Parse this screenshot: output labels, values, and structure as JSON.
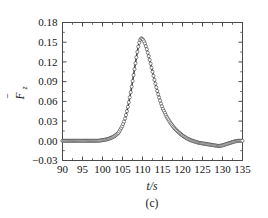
{
  "figure": {
    "caption": "(c)",
    "background_color": "#ffffff",
    "curve_color": "#3a3a3a",
    "axis_color": "#4a4a4a",
    "text_color": "#151515"
  },
  "chart_data": {
    "type": "line",
    "title": "",
    "subtitle": "",
    "xlabel": "t/s",
    "ylabel": "F̄z",
    "ylabel_parts": {
      "symbol": "F",
      "overbar": true,
      "subscript": "z"
    },
    "xlim": [
      90,
      135
    ],
    "ylim": [
      -0.03,
      0.18
    ],
    "xticks": [
      90,
      95,
      100,
      105,
      110,
      115,
      120,
      125,
      130,
      135
    ],
    "xtick_labels": [
      "90",
      "95",
      "100",
      "105",
      "110",
      "115",
      "120",
      "125",
      "130",
      "135"
    ],
    "yticks": [
      -0.03,
      0.0,
      0.03,
      0.06,
      0.09,
      0.12,
      0.15,
      0.18
    ],
    "ytick_labels": [
      "−0.03",
      "0.00",
      "0.03",
      "0.06",
      "0.09",
      "0.12",
      "0.15",
      "0.18"
    ],
    "x_minor_per_major": 1,
    "y_minor_per_major": 1,
    "grid": false,
    "legend": null,
    "marker": "open-circle",
    "marker_size": 1.6,
    "peak": {
      "x": 109.6,
      "y": 0.156
    },
    "baseline": 0.0,
    "x": [
      90,
      91,
      92,
      93,
      94,
      95,
      96,
      97,
      98,
      99,
      100,
      101,
      102,
      103,
      104,
      105,
      105.5,
      106,
      106.5,
      107,
      107.5,
      108,
      108.5,
      109,
      109.3,
      109.6,
      110,
      110.5,
      111,
      111.5,
      112,
      112.5,
      113,
      113.5,
      114,
      114.5,
      115,
      116,
      117,
      118,
      119,
      120,
      121,
      122,
      123,
      124,
      125,
      126,
      127,
      128,
      129,
      130,
      131,
      132,
      133,
      134,
      135
    ],
    "y": [
      0.0,
      0.0,
      0.0,
      0.0,
      0.0,
      0.0,
      0.0,
      0.0,
      0.0,
      0.0,
      0.001,
      0.002,
      0.004,
      0.007,
      0.012,
      0.023,
      0.031,
      0.042,
      0.056,
      0.072,
      0.09,
      0.109,
      0.128,
      0.145,
      0.152,
      0.156,
      0.155,
      0.15,
      0.141,
      0.13,
      0.118,
      0.105,
      0.092,
      0.08,
      0.069,
      0.059,
      0.05,
      0.037,
      0.027,
      0.019,
      0.013,
      0.008,
      0.004,
      0.001,
      -0.001,
      -0.003,
      -0.004,
      -0.005,
      -0.006,
      -0.007,
      -0.008,
      -0.007,
      -0.005,
      -0.003,
      -0.001,
      0.0,
      0.0
    ]
  }
}
